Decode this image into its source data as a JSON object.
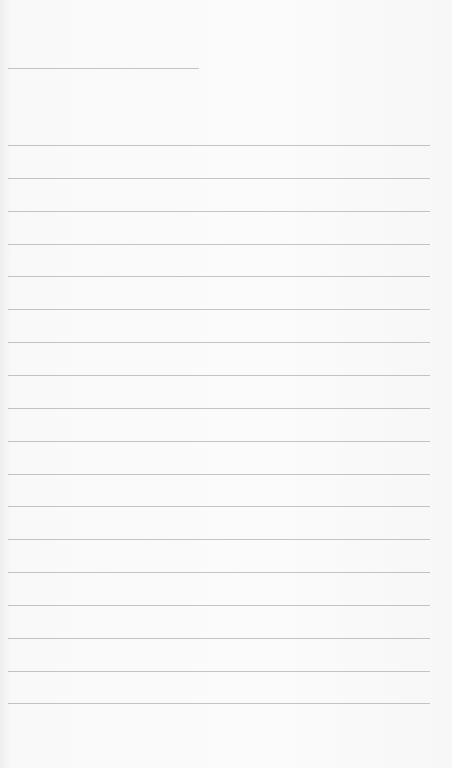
{
  "document": {
    "type": "lined-paper",
    "header_line": {
      "y": 68,
      "x": 8,
      "width": 191
    },
    "lines": {
      "count": 18,
      "first_y": 145,
      "spacing": 32.85,
      "x": 8,
      "width": 422
    },
    "colors": {
      "paper": "#fafafa",
      "line": "#b9b9b9"
    }
  }
}
